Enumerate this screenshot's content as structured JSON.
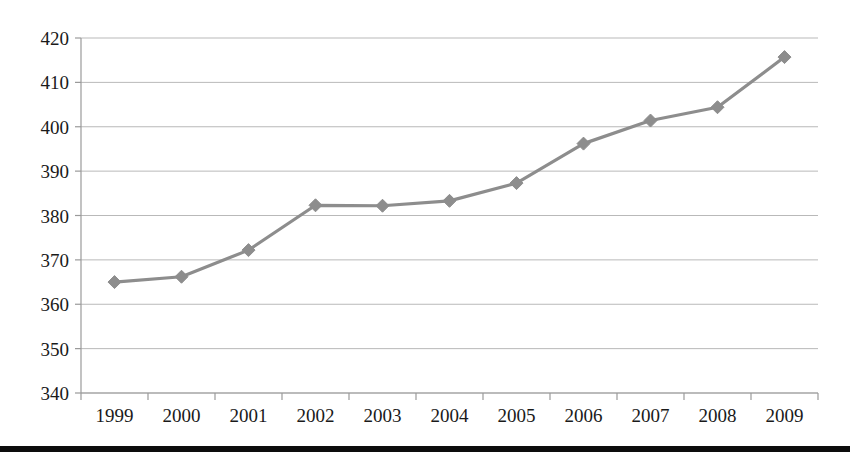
{
  "chart_data": {
    "type": "line",
    "title": "",
    "subtitle": "",
    "xlabel": "",
    "ylabel": "",
    "categories": [
      "1999",
      "2000",
      "2001",
      "2002",
      "2003",
      "2004",
      "2005",
      "2006",
      "2007",
      "2008",
      "2009"
    ],
    "values": [
      365.0,
      366.2,
      372.2,
      382.3,
      382.2,
      383.3,
      387.3,
      396.2,
      401.4,
      404.4,
      415.7
    ],
    "series": [
      {
        "name": "",
        "values": [
          365.0,
          366.2,
          372.2,
          382.3,
          382.2,
          383.3,
          387.3,
          396.2,
          401.4,
          404.4,
          415.7
        ]
      }
    ],
    "ylim": [
      340,
      420
    ],
    "ytick_labels": [
      "340",
      "350",
      "360",
      "370",
      "380",
      "390",
      "400",
      "410",
      "420"
    ],
    "ytick_values": [
      340,
      350,
      360,
      370,
      380,
      390,
      400,
      410,
      420
    ],
    "xtick_labels": [
      "1999",
      "2000",
      "2001",
      "2002",
      "2003",
      "2004",
      "2005",
      "2006",
      "2007",
      "2008",
      "2009"
    ],
    "grid": "horizontal",
    "legend": "none",
    "marker": "diamond",
    "line_color": "#8d8d8d",
    "marker_color": "#8d8d8d",
    "grid_color": "#b9b9b9",
    "axis_color": "#9a9a9a",
    "text_color": "#1a1a1a",
    "annotations": []
  },
  "footer": {
    "rule_color": "#0d0d0d"
  }
}
